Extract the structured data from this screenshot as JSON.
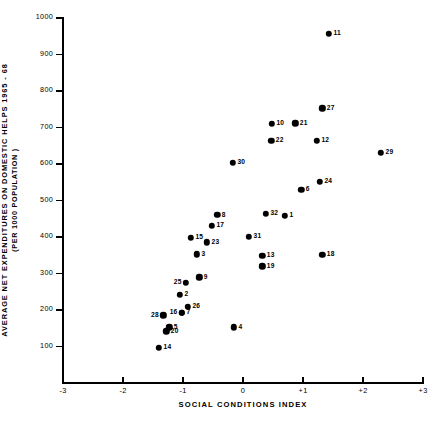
{
  "chart_data": {
    "type": "scatter",
    "title": "",
    "xlabel": "SOCIAL  CONDITIONS  INDEX",
    "ylabel_line1": "AVERAGE  NET  EXPENDITURES  ON  DOMESTIC  HELPS  1965 - 68",
    "ylabel_line2": "(PER 1000 POPULATION )",
    "xlim": [
      -3,
      3
    ],
    "ylim": [
      0,
      1000
    ],
    "grid": false,
    "legend": "none",
    "xticks": [
      -3,
      -2,
      -1,
      0,
      1,
      2,
      3
    ],
    "xtick_labels": [
      "-3",
      "-2",
      "-1",
      "0",
      "+1",
      "+2",
      "+3"
    ],
    "yticks": [
      100,
      200,
      300,
      400,
      500,
      600,
      700,
      800,
      900,
      1000
    ],
    "ytick_labels": [
      "100",
      "200",
      "300",
      "400",
      "500",
      "600",
      "700",
      "800",
      "900",
      "1000"
    ],
    "point_label_position": "right",
    "marker": "filled-circle",
    "marker_color": "#000000",
    "points": [
      {
        "label": "11",
        "x": 1.43,
        "y": 956
      },
      {
        "label": "27",
        "x": 1.32,
        "y": 753
      },
      {
        "label": "21",
        "x": 0.87,
        "y": 712
      },
      {
        "label": "10",
        "x": 0.48,
        "y": 710
      },
      {
        "label": "22",
        "x": 0.47,
        "y": 663
      },
      {
        "label": "12",
        "x": 1.23,
        "y": 663
      },
      {
        "label": "29",
        "x": 2.3,
        "y": 630
      },
      {
        "label": "30",
        "x": -0.17,
        "y": 603
      },
      {
        "label": "24",
        "x": 1.28,
        "y": 551
      },
      {
        "label": "6",
        "x": 0.97,
        "y": 529
      },
      {
        "label": "32",
        "x": 0.38,
        "y": 463
      },
      {
        "label": "1",
        "x": 0.7,
        "y": 458
      },
      {
        "label": "8",
        "x": -0.43,
        "y": 460
      },
      {
        "label": "17",
        "x": -0.52,
        "y": 430
      },
      {
        "label": "31",
        "x": 0.1,
        "y": 400
      },
      {
        "label": "15",
        "x": -0.87,
        "y": 397
      },
      {
        "label": "23",
        "x": -0.6,
        "y": 386
      },
      {
        "label": "13",
        "x": 0.32,
        "y": 348
      },
      {
        "label": "3",
        "x": -0.77,
        "y": 353
      },
      {
        "label": "19",
        "x": 0.32,
        "y": 320
      },
      {
        "label": "18",
        "x": 1.32,
        "y": 351
      },
      {
        "label": "9",
        "x": -0.73,
        "y": 290
      },
      {
        "label": "25",
        "x": -0.95,
        "y": 274
      },
      {
        "label": "2",
        "x": -1.05,
        "y": 241
      },
      {
        "label": "26",
        "x": -0.92,
        "y": 208
      },
      {
        "label": "16",
        "x": -1.02,
        "y": 192
      },
      {
        "label": "7",
        "x": -1.02,
        "y": 192
      },
      {
        "label": "28",
        "x": -1.33,
        "y": 186
      },
      {
        "label": "5",
        "x": -1.23,
        "y": 153
      },
      {
        "label": "20",
        "x": -1.28,
        "y": 142
      },
      {
        "label": "4",
        "x": -0.15,
        "y": 153
      },
      {
        "label": "14",
        "x": -1.4,
        "y": 96
      }
    ]
  }
}
